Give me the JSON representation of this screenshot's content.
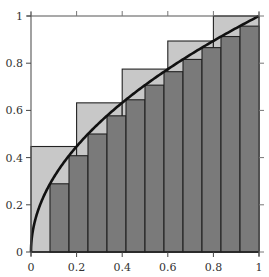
{
  "chart_data": {
    "type": "bar",
    "title": "",
    "xlabel": "",
    "ylabel": "",
    "xlim": [
      0,
      1
    ],
    "ylim": [
      0,
      1
    ],
    "grid": false,
    "legend": null,
    "x_ticks": [
      "0",
      "0.2",
      "0.4",
      "0.6",
      "0.8",
      "1"
    ],
    "y_ticks": [
      "0",
      "0.2",
      "0.4",
      "0.6",
      "0.8",
      "1"
    ],
    "curve": {
      "name": "y = sqrt(x)",
      "color": "#111111"
    },
    "series": [
      {
        "name": "upper sum (5 intervals, right endpoints)",
        "color": "#c8c8c8",
        "x_edges": [
          0,
          0.2,
          0.4,
          0.6,
          0.8,
          1.0
        ],
        "values": [
          0.447,
          0.632,
          0.775,
          0.894,
          1.0
        ]
      },
      {
        "name": "lower sum (12 intervals, left endpoints)",
        "color": "#7a7a7a",
        "x_edges": [
          0,
          0.0833,
          0.1667,
          0.25,
          0.3333,
          0.4167,
          0.5,
          0.5833,
          0.6667,
          0.75,
          0.8333,
          0.9167,
          1.0
        ],
        "values": [
          0,
          0.289,
          0.408,
          0.5,
          0.577,
          0.645,
          0.707,
          0.764,
          0.816,
          0.866,
          0.913,
          0.957
        ]
      }
    ]
  },
  "axes": {
    "x_ticks": [
      "0",
      "0.2",
      "0.4",
      "0.6",
      "0.8",
      "1"
    ],
    "y_ticks": [
      "0",
      "0.2",
      "0.4",
      "0.6",
      "0.8",
      "1"
    ]
  }
}
